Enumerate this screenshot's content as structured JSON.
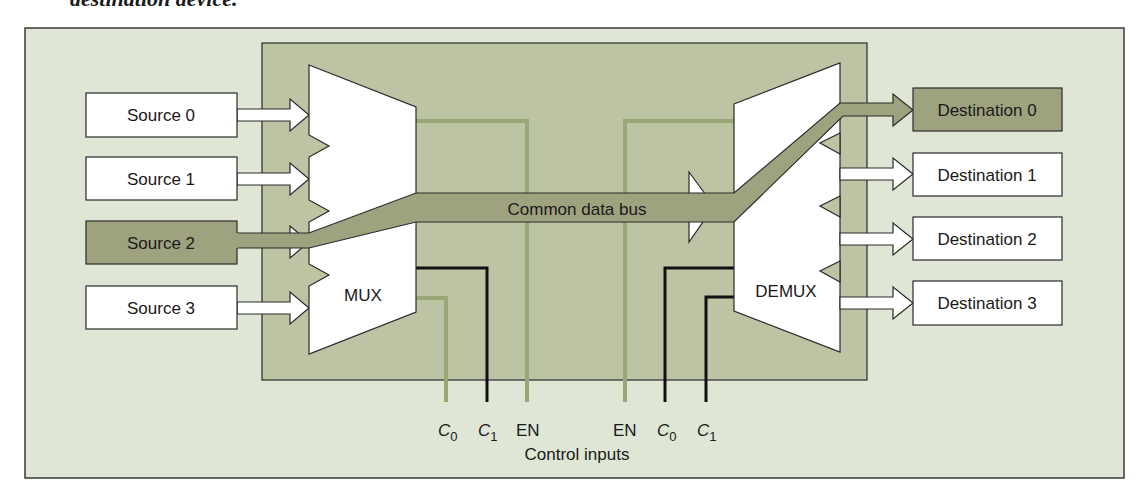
{
  "caption_fragment": "destination device.",
  "colors": {
    "outer_bg": "#dfe6d5",
    "inner_bg": "#bcc4a4",
    "highlight": "#9ea27e",
    "control_green": "#9aa676",
    "control_black": "#111111",
    "stroke": "#2a2a2a",
    "white": "#ffffff"
  },
  "sources": [
    {
      "label": "Source 0",
      "selected": false
    },
    {
      "label": "Source 1",
      "selected": false
    },
    {
      "label": "Source 2",
      "selected": true
    },
    {
      "label": "Source 3",
      "selected": false
    }
  ],
  "destinations": [
    {
      "label": "Destination 0",
      "selected": true
    },
    {
      "label": "Destination 1",
      "selected": false
    },
    {
      "label": "Destination 2",
      "selected": false
    },
    {
      "label": "Destination 3",
      "selected": false
    }
  ],
  "mux": {
    "label": "MUX"
  },
  "demux": {
    "label": "DEMUX"
  },
  "bus": {
    "label": "Common data bus"
  },
  "controls": {
    "mux": {
      "c0": "C",
      "c0_sub": "0",
      "c1": "C",
      "c1_sub": "1",
      "en": "EN"
    },
    "demux": {
      "en": "EN",
      "c0": "C",
      "c0_sub": "0",
      "c1": "C",
      "c1_sub": "1"
    },
    "caption": "Control inputs"
  }
}
